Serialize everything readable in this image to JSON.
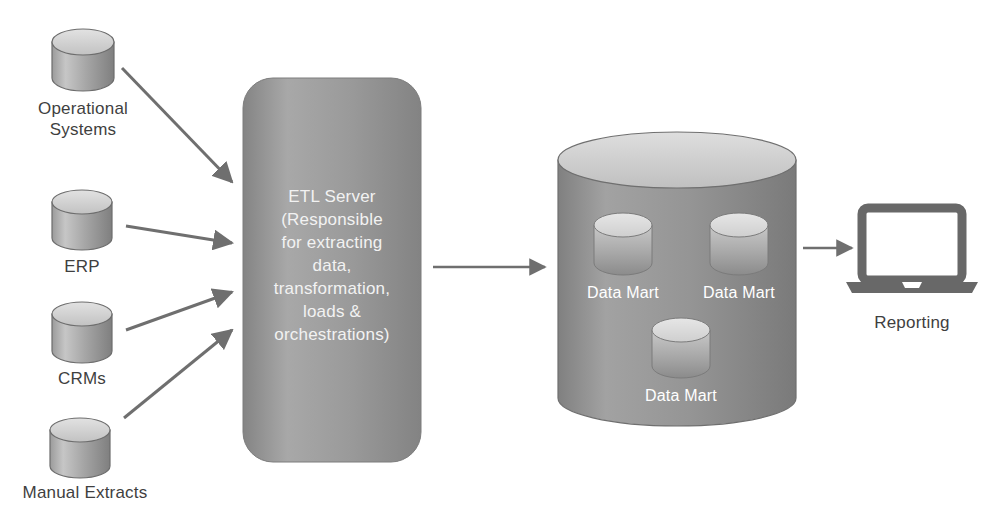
{
  "diagram": {
    "background_color": "#ffffff",
    "colors": {
      "cylinder_light": "#d8d8d8",
      "cylinder_dark": "#8c8c8c",
      "etl_box": "#9a9a9a",
      "warehouse_body": "#8f8f8f",
      "warehouse_top": "#d4d4d4",
      "arrow": "#6f6f6f",
      "text_dark": "#3f3f3f",
      "text_light": "#ffffff",
      "laptop": "#666666"
    },
    "sources": [
      {
        "id": "operational-systems",
        "label": "Operational\nSystems",
        "icon": "database-cylinder-icon"
      },
      {
        "id": "erp",
        "label": "ERP",
        "icon": "database-cylinder-icon"
      },
      {
        "id": "crms",
        "label": "CRMs",
        "icon": "database-cylinder-icon"
      },
      {
        "id": "manual-extracts",
        "label": "Manual Extracts",
        "icon": "database-cylinder-icon"
      }
    ],
    "etl": {
      "id": "etl-server",
      "label": "ETL Server\n(Responsible\nfor extracting\ndata,\ntransformation,\nloads &\norchestrations)",
      "shape": "rounded-rectangle"
    },
    "warehouse": {
      "id": "data-warehouse",
      "shape": "cylinder",
      "marts": [
        {
          "id": "data-mart-1",
          "label": "Data Mart"
        },
        {
          "id": "data-mart-2",
          "label": "Data Mart"
        },
        {
          "id": "data-mart-3",
          "label": "Data Mart"
        }
      ]
    },
    "reporting": {
      "id": "reporting",
      "label": "Reporting",
      "icon": "laptop-icon"
    },
    "arrows": [
      {
        "id": "arrow-operational-to-etl",
        "from": "operational-systems",
        "to": "etl-server"
      },
      {
        "id": "arrow-erp-to-etl",
        "from": "erp",
        "to": "etl-server"
      },
      {
        "id": "arrow-crms-to-etl",
        "from": "crms",
        "to": "etl-server"
      },
      {
        "id": "arrow-manual-to-etl",
        "from": "manual-extracts",
        "to": "etl-server"
      },
      {
        "id": "arrow-etl-to-warehouse",
        "from": "etl-server",
        "to": "data-warehouse"
      },
      {
        "id": "arrow-warehouse-to-reporting",
        "from": "data-warehouse",
        "to": "reporting"
      }
    ]
  }
}
